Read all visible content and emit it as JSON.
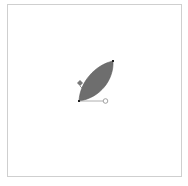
{
  "canvas": {
    "background": "#ffffff",
    "border_color": "#cfcfcf"
  },
  "shape": {
    "type": "leaf-path",
    "fill": "#6e6e6e",
    "anchors": [
      {
        "name": "top-right",
        "x": 113,
        "y": 61
      },
      {
        "name": "bottom-left",
        "x": 79,
        "y": 101
      }
    ],
    "handle": {
      "x": 105,
      "y": 101,
      "color": "#9a9a9a"
    }
  },
  "cursor": {
    "icon": "pen-tool-icon",
    "x": 80,
    "y": 83
  }
}
